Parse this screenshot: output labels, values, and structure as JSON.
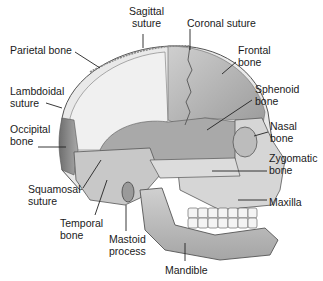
{
  "figure": {
    "colors": {
      "background": "#ffffff",
      "parietal": "#ececec",
      "frontal": "#bdbdbd",
      "occipital": "#8c8c8c",
      "temporal": "#c6c6c6",
      "sphenoid": "#a8a8a8",
      "face": "#d4d4d4",
      "leader_line": "#222222",
      "label_text": "#1a1a1a"
    },
    "labels": [
      {
        "id": "sagittal-suture",
        "text": "Sagittal\nsuture",
        "x": 140,
        "y": 5
      },
      {
        "id": "coronal-suture",
        "text": "Coronal suture",
        "x": 187,
        "y": 17
      },
      {
        "id": "parietal-bone",
        "text": "Parietal bone",
        "x": 10,
        "y": 44
      },
      {
        "id": "frontal-bone",
        "text": "Frontal\nbone",
        "x": 238,
        "y": 44
      },
      {
        "id": "sphenoid-bone",
        "text": "Sphenoid\nbone",
        "x": 255,
        "y": 83
      },
      {
        "id": "lambdoidal-suture",
        "text": "Lambdoidal\nsuture",
        "x": 10,
        "y": 85
      },
      {
        "id": "nasal-bone",
        "text": "Nasal\nbone",
        "x": 270,
        "y": 120
      },
      {
        "id": "occipital-bone",
        "text": "Occipital\nbone",
        "x": 10,
        "y": 123
      },
      {
        "id": "zygomatic-bone",
        "text": "Zygomatic\nbone",
        "x": 269,
        "y": 152
      },
      {
        "id": "maxilla",
        "text": "Maxilla",
        "x": 269,
        "y": 196
      },
      {
        "id": "squamosal-suture",
        "text": "Squamosal\nsuture",
        "x": 28,
        "y": 183
      },
      {
        "id": "temporal-bone",
        "text": "Temporal\nbone",
        "x": 60,
        "y": 217
      },
      {
        "id": "mastoid-process",
        "text": "Mastoid\nprocess",
        "x": 109,
        "y": 233
      },
      {
        "id": "mandible",
        "text": "Mandible",
        "x": 165,
        "y": 264
      }
    ]
  }
}
